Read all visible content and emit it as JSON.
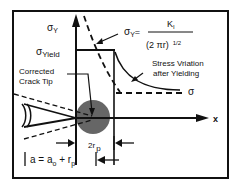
{
  "diagram": {
    "y_axis": {
      "symbol": "σ",
      "subscript": "Y"
    },
    "x_axis": {
      "label": "x"
    },
    "yield_label": {
      "symbol": "σ",
      "subscript": "Yield"
    },
    "equation": {
      "lhs_symbol": "σ",
      "lhs_subscript": "Y",
      "equals": "=",
      "numerator": "K",
      "numerator_subscript": "I",
      "denominator": "(2 πr)",
      "denominator_exponent": "1/2"
    },
    "corrected_crack_tip": {
      "line1": "Corrected",
      "line2": "Crack Tip"
    },
    "stress_variation": {
      "line1": "Stress Vriation",
      "line2": "after Yielding"
    },
    "sigma_far": "σ",
    "plastic_zone_width": {
      "prefix": "2r",
      "subscript": "p"
    },
    "crack_length": {
      "text_a": "a = a",
      "sub_o": "o",
      "plus": " + r",
      "sub_p": "p"
    },
    "colors": {
      "line": "#111111",
      "plastic_zone_fill": "#555555",
      "background": "#ffffff"
    }
  }
}
